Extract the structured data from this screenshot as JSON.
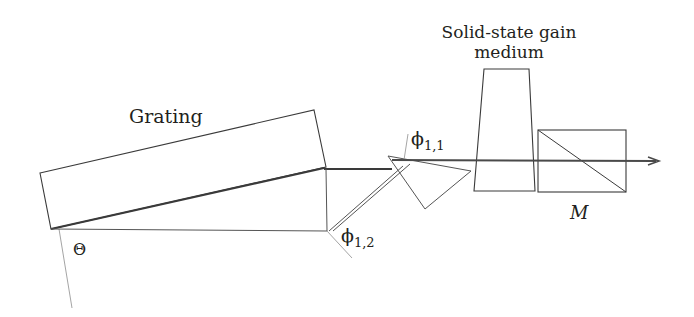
{
  "diagram": {
    "type": "optical-layout",
    "labels": {
      "grating": "Grating",
      "gain_medium_line1": "Solid-state gain",
      "gain_medium_line2": "medium",
      "theta": "Θ",
      "phi11_base": "ϕ",
      "phi11_sub": "1,1",
      "phi12_base": "ϕ",
      "phi12_sub": "1,2",
      "mirror": "M"
    },
    "components": [
      {
        "id": "grating",
        "shape": "tilted-rectangle"
      },
      {
        "id": "prism",
        "shape": "triangle"
      },
      {
        "id": "gain-medium",
        "shape": "trapezoid"
      },
      {
        "id": "output-mirror",
        "shape": "rectangle-with-diagonal"
      }
    ],
    "colors": {
      "line": "#3a3a3a",
      "beam": "#4a4a4a",
      "normal": "#9a9a9a",
      "text": "#231f20"
    }
  }
}
